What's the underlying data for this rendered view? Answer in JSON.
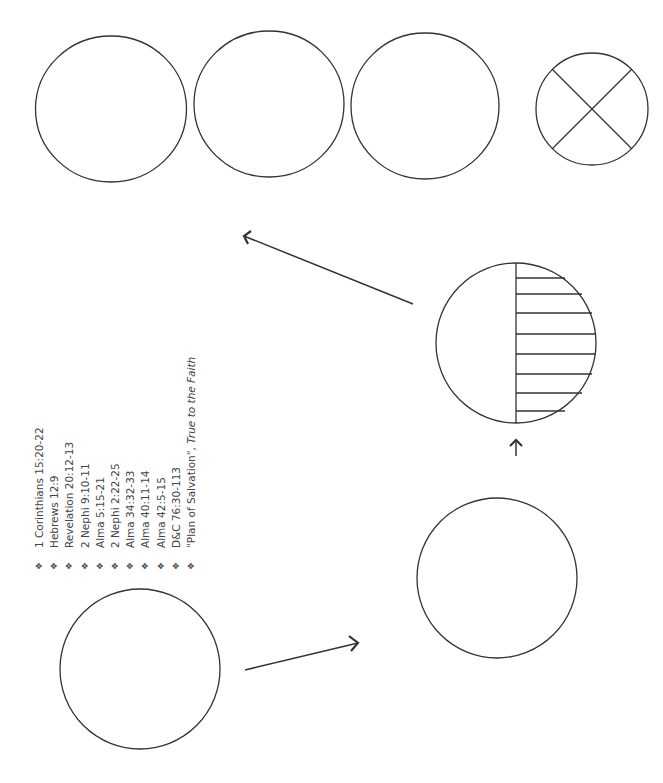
{
  "diagram": {
    "stroke_color": "#333333",
    "background": "#ffffff",
    "circles": [
      {
        "id": "top-1",
        "style": "empty"
      },
      {
        "id": "top-2",
        "style": "empty"
      },
      {
        "id": "top-3",
        "style": "empty"
      },
      {
        "id": "top-4",
        "style": "x-divided"
      },
      {
        "id": "middle-right",
        "style": "half-hatched"
      },
      {
        "id": "bottom-left",
        "style": "empty"
      },
      {
        "id": "bottom-right",
        "style": "empty"
      }
    ],
    "arrows": [
      {
        "from": "bottom-left",
        "to": "bottom-right"
      },
      {
        "from": "bottom-right",
        "to": "middle-right"
      },
      {
        "from": "middle-right",
        "to": "top-row"
      }
    ]
  },
  "references": {
    "bullet_icon": "❖",
    "items": [
      {
        "text": "1 Corinthians 15:20-22"
      },
      {
        "text": "Hebrews 12:9"
      },
      {
        "text": "Revelation 20:12-13"
      },
      {
        "text": "2 Nephi 9:10-11"
      },
      {
        "text": "Alma 5:15-21"
      },
      {
        "text": "2 Nephi 2:22-25"
      },
      {
        "text": "Alma 34:32-33"
      },
      {
        "text": "Alma 40:11-14"
      },
      {
        "text": "Alma 42:5-15"
      },
      {
        "text": "D&C 76:30-113"
      },
      {
        "text": "\"Plan of Salvation\", ",
        "italic_suffix": "True to the Faith"
      }
    ]
  }
}
